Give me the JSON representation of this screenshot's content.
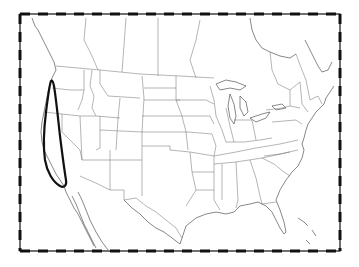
{
  "map": {
    "region": "North America (United States, southern Canada, northern Mexico)",
    "projection_frame": {
      "x": 20,
      "y": 14,
      "width": 320,
      "height": 237,
      "style": "alternating black/white dashed neatline"
    },
    "layers": [
      {
        "name": "coastlines",
        "color": "#555555"
      },
      {
        "name": "state-province-boundaries",
        "color": "#777777"
      },
      {
        "name": "highlight-loop",
        "color": "#111111"
      }
    ],
    "highlight": {
      "shape": "closed elongated loop",
      "area": "US West Coast — Washington, Oregon, California",
      "top": [
        51,
        81
      ],
      "bottom": [
        65,
        187
      ],
      "stroke_width": 2.2
    },
    "labels": []
  },
  "colors": {
    "background": "#ffffff",
    "frame_dark": "#111111",
    "frame_light": "#ffffff",
    "lines": "#6e6e6e",
    "highlight": "#111111"
  }
}
